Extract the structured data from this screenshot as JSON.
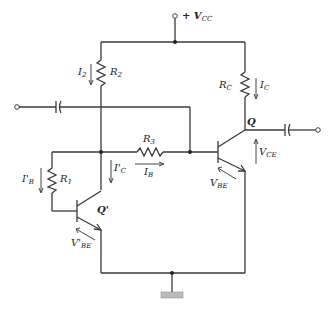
{
  "diagram": {
    "type": "circuit-schematic",
    "title": "",
    "labels": {
      "vcc": {
        "prefix": "+ V",
        "sub": "CC"
      },
      "r1": {
        "main": "R",
        "sub": "1"
      },
      "r2": {
        "main": "R",
        "sub": "2"
      },
      "r3": {
        "main": "R",
        "sub": "3"
      },
      "rc": {
        "main": "R",
        "sub": "C"
      },
      "i2": {
        "main": "I",
        "sub": "2"
      },
      "ic": {
        "main": "I",
        "sub": "C"
      },
      "ic_prime": {
        "main": "I'",
        "sub": "C"
      },
      "ib": {
        "main": "I",
        "sub": "B"
      },
      "ib_prime": {
        "main": "I'",
        "sub": "B"
      },
      "vbe": {
        "main": "V",
        "sub": "BE"
      },
      "vbe_prime": {
        "main": "V'",
        "sub": "BE"
      },
      "vce": {
        "main": "V",
        "sub": "CE"
      },
      "q": "Q",
      "q_prime": "Q'"
    },
    "components": [
      {
        "id": "R1",
        "kind": "resistor"
      },
      {
        "id": "R2",
        "kind": "resistor"
      },
      {
        "id": "R3",
        "kind": "resistor"
      },
      {
        "id": "RC",
        "kind": "resistor"
      },
      {
        "id": "Q",
        "kind": "npn-transistor"
      },
      {
        "id": "Q'",
        "kind": "npn-transistor"
      },
      {
        "id": "C_in",
        "kind": "capacitor"
      },
      {
        "id": "C_out",
        "kind": "capacitor"
      },
      {
        "id": "GND",
        "kind": "ground"
      },
      {
        "id": "VCC",
        "kind": "supply-terminal"
      }
    ],
    "colors": {
      "line": "#3a3a3a",
      "background": "#ffffff"
    }
  }
}
